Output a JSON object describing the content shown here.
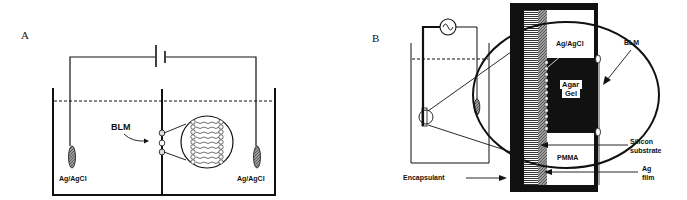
{
  "panel_a": {
    "label": "A",
    "electrode_left": "Ag/AgCl",
    "electrode_right": "Ag/AgCl",
    "membrane": "BLM",
    "source": "dc-battery"
  },
  "panel_b": {
    "label": "B",
    "source": "ac-source",
    "labels": {
      "ag_agcl": "Ag/AgCl",
      "blm": "BLM",
      "agar": "Agar",
      "gel": "Gel",
      "silicon1": "Silicon",
      "silicon2": "substrate",
      "pmma": "PMMA",
      "ag1": "Ag",
      "ag2": "film",
      "encapsulant": "Encapsulant"
    }
  },
  "colors": {
    "ink": "#111111",
    "background": "#ffffff",
    "hatch": "#888888"
  }
}
